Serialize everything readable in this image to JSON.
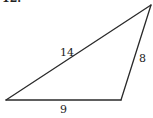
{
  "problem_number": "12.",
  "triangle": {
    "sides": [
      {
        "name": "hypotenuse-side",
        "label": "14"
      },
      {
        "name": "right-side",
        "label": "8"
      },
      {
        "name": "base-side",
        "label": "9"
      }
    ]
  }
}
